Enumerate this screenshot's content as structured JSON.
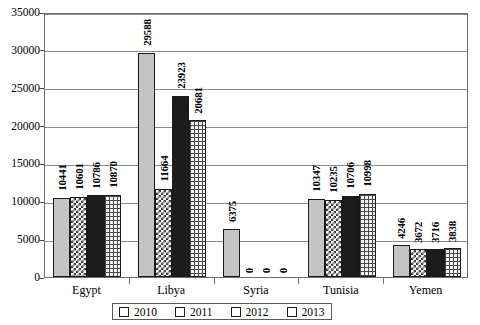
{
  "chart_data": {
    "type": "bar",
    "title": "",
    "subtitle": "",
    "xlabel": "",
    "ylabel": "",
    "categories": [
      "Egypt",
      "Libya",
      "Syria",
      "Tunisia",
      "Yemen"
    ],
    "series": [
      {
        "name": "2010",
        "values": [
          10441,
          29588,
          6375,
          10347,
          4246
        ],
        "pattern": "solid-light-gray",
        "color": "#c4c4c4"
      },
      {
        "name": "2011",
        "values": [
          10601,
          11664,
          0,
          10235,
          3672
        ],
        "pattern": "checkerboard",
        "color": "#3a3a3a"
      },
      {
        "name": "2012",
        "values": [
          10786,
          23923,
          0,
          10706,
          3716
        ],
        "pattern": "solid-black",
        "color": "#1c1c1c"
      },
      {
        "name": "2013",
        "values": [
          10870,
          20681,
          0,
          10998,
          3838
        ],
        "pattern": "grid",
        "color": "#4a4a4a"
      }
    ],
    "ylim": [
      0,
      35000
    ],
    "ytick_labels": [
      "0",
      "5000",
      "10000",
      "15000",
      "20000",
      "25000",
      "30000",
      "35000"
    ],
    "ytick_values": [
      0,
      5000,
      10000,
      15000,
      20000,
      25000,
      30000,
      35000
    ],
    "grid": true,
    "legend_position": "bottom",
    "value_labels_shown": true,
    "value_labels_rotation": "vertical"
  },
  "legend": {
    "entries": [
      {
        "label": "2010",
        "icon": "legend-swatch-solid-light-icon"
      },
      {
        "label": "2011",
        "icon": "legend-swatch-checker-icon"
      },
      {
        "label": "2012",
        "icon": "legend-swatch-solid-black-icon"
      },
      {
        "label": "2013",
        "icon": "legend-swatch-grid-icon"
      }
    ]
  }
}
